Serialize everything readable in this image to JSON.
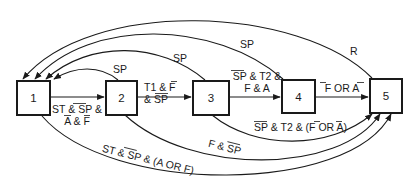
{
  "diagram": {
    "type": "state-transition",
    "states": [
      {
        "id": "1",
        "label": "1"
      },
      {
        "id": "2",
        "label": "2"
      },
      {
        "id": "3",
        "label": "3"
      },
      {
        "id": "4",
        "label": "4"
      },
      {
        "id": "5",
        "label": "5"
      }
    ],
    "transitions": [
      {
        "from": "1",
        "to": "2",
        "label_line1": "ST & SP &",
        "label_line2": "A & F",
        "overlines": [
          "SP",
          "A",
          "F"
        ]
      },
      {
        "from": "2",
        "to": "3",
        "label_line1": "T1 & F",
        "label_line2": "& SP",
        "overlines": [
          "F",
          "SP"
        ]
      },
      {
        "from": "3",
        "to": "4",
        "label_line1": "SP & T2 &",
        "label_line2": "F & A",
        "overlines": [
          "SP"
        ]
      },
      {
        "from": "4",
        "to": "5",
        "label": "F OR A",
        "overlines": [
          "F",
          "A"
        ]
      },
      {
        "from": "2",
        "to": "1",
        "label": "SP"
      },
      {
        "from": "3",
        "to": "1",
        "label": "SP"
      },
      {
        "from": "4",
        "to": "1",
        "label": "SP"
      },
      {
        "from": "5",
        "to": "1",
        "label": "R"
      },
      {
        "from": "3",
        "to": "5",
        "label": "SP & T2 & (F OR A)",
        "overlines": [
          "SP",
          "F",
          "A"
        ]
      },
      {
        "from": "2",
        "to": "5",
        "label": "F & SP",
        "overlines": [
          "SP"
        ]
      },
      {
        "from": "1",
        "to": "5",
        "label": "ST & SP & (A OR F)",
        "overlines": [
          "SP"
        ]
      }
    ]
  }
}
